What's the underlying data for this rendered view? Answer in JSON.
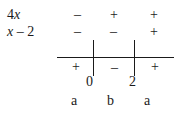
{
  "rows": [
    {
      "label_coef": "4",
      "label_var": "x",
      "signs": [
        "–",
        "+",
        "+"
      ]
    },
    {
      "label_var": "x",
      "label_rest": " – 2",
      "signs": [
        "–",
        "–",
        "+"
      ]
    }
  ],
  "result_signs": [
    "+",
    "–",
    "+"
  ],
  "critical_points": [
    "0",
    "2"
  ],
  "interval_labels": [
    "a",
    "b",
    "a"
  ]
}
